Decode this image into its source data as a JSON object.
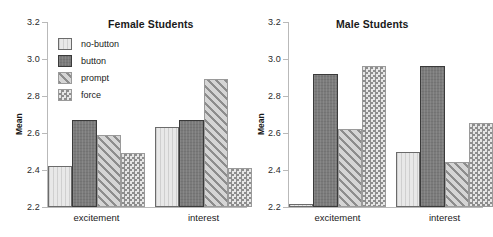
{
  "chart_data": [
    {
      "type": "bar",
      "title": "Female Students",
      "xlabel": "",
      "ylabel": "Mean",
      "ylim": [
        2.2,
        3.2
      ],
      "yticks": [
        2.2,
        2.4,
        2.6,
        2.8,
        3.0,
        3.2
      ],
      "ytick_labels": [
        "2.2",
        "2.4",
        "2.6",
        "2.8",
        "3.0",
        "3.2"
      ],
      "grid": false,
      "legend_position": "upper-left",
      "categories": [
        "excitement",
        "interest"
      ],
      "series": [
        {
          "name": "no-button",
          "values": [
            2.42,
            2.63
          ]
        },
        {
          "name": "button",
          "values": [
            2.67,
            2.67
          ]
        },
        {
          "name": "prompt",
          "values": [
            2.59,
            2.89
          ]
        },
        {
          "name": "force",
          "values": [
            2.49,
            2.41
          ]
        }
      ]
    },
    {
      "type": "bar",
      "title": "Male Students",
      "xlabel": "",
      "ylabel": "Mean",
      "ylim": [
        2.2,
        3.2
      ],
      "yticks": [
        2.2,
        2.4,
        2.6,
        2.8,
        3.0,
        3.2
      ],
      "ytick_labels": [
        "2.2",
        "2.4",
        "2.6",
        "2.8",
        "3.0",
        "3.2"
      ],
      "grid": false,
      "legend_position": "none",
      "categories": [
        "excitement",
        "interest"
      ],
      "series": [
        {
          "name": "no-button",
          "values": [
            2.215,
            2.5
          ]
        },
        {
          "name": "button",
          "values": [
            2.92,
            2.96
          ]
        },
        {
          "name": "prompt",
          "values": [
            2.62,
            2.445
          ]
        },
        {
          "name": "force",
          "values": [
            2.96,
            2.655
          ]
        }
      ]
    }
  ],
  "legend": {
    "items": [
      {
        "label": "no-button",
        "style": "s-nobutton",
        "color": "#e8e8e8"
      },
      {
        "label": "button",
        "style": "s-button",
        "color": "#7b7b7b"
      },
      {
        "label": "prompt",
        "style": "s-prompt",
        "color": "#8d8d8d"
      },
      {
        "label": "force",
        "style": "s-force",
        "color": "#8d8d8d"
      }
    ]
  }
}
